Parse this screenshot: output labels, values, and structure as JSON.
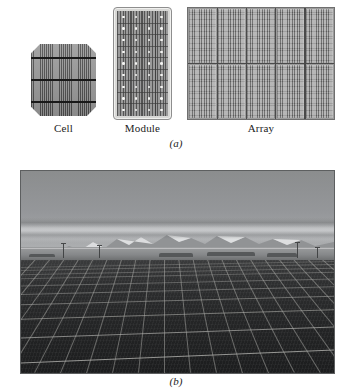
{
  "figure": {
    "type": "two-panel textbook figure",
    "panel_a": {
      "caption": "(a)",
      "items": [
        {
          "id": "cell",
          "label": "Cell",
          "shape": "octagonal pseudo-square wafer",
          "busbars": 3,
          "finger_lines": "dense vertical grid fingers",
          "color": "#6e6e6e"
        },
        {
          "id": "module",
          "label": "Module",
          "shape": "rectangular framed panel, portrait orientation",
          "frame_color": "#d8d8d6",
          "cell_columns": 4,
          "cell_rows": 9,
          "interconnect_dots": "white solder points at cell corners",
          "color": "#8d8d8d"
        },
        {
          "id": "array",
          "label": "Array",
          "shape": "grid of modules, landscape orientation",
          "module_columns": 5,
          "module_rows": 2,
          "color": "#a3a3a3"
        }
      ]
    },
    "panel_b": {
      "caption": "(b)",
      "photo": {
        "description": "Large ground-mounted photovoltaic array field with snow-capped mountain range on the horizon",
        "rendering": "black and white photograph",
        "sky_color": "#9b9d9e",
        "mountain_color": "#d9dadc",
        "panel_color": "#262728",
        "frame_color": "#b9b9b5",
        "elements": [
          "hazy sky",
          "snow-capped mountain range",
          "distant treeline and utility poles",
          "flat open ground",
          "rows of dark solar panels receding in perspective"
        ]
      }
    }
  },
  "colors": {
    "page_background": "#ffffff",
    "text": "#232323",
    "diagram_dark": "#4e4e4e",
    "diagram_mid": "#9a9a9a",
    "busbar": "#191919"
  }
}
